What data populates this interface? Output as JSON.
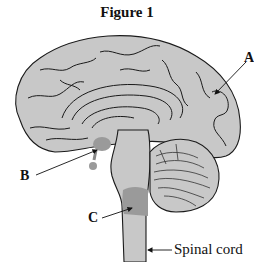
{
  "figure": {
    "title": "Figure 1",
    "labels": {
      "A": "A",
      "B": "B",
      "C": "C",
      "spinal_cord": "Spinal cord"
    },
    "colors": {
      "brain_fill": "#c8c8c8",
      "highlight_fill": "#9a9a9a",
      "outline": "#1a1a1a",
      "background": "#ffffff"
    },
    "regions": [
      {
        "label": "A",
        "structure": "cerebrum (frontal/cortex region)"
      },
      {
        "label": "B",
        "structure": "pituitary / hypothalamus region (shaded)"
      },
      {
        "label": "C",
        "structure": "medulla oblongata (shaded)"
      },
      {
        "label": "Spinal cord",
        "structure": "spinal cord"
      }
    ]
  }
}
